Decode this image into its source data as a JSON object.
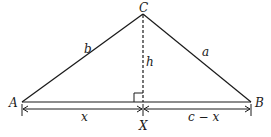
{
  "diagram": {
    "type": "triangle-altitude",
    "vertices": {
      "A": "A",
      "B": "B",
      "C": "C"
    },
    "foot": "X",
    "sides": {
      "b": "b",
      "a": "a",
      "h": "h"
    },
    "segments": {
      "left": "x",
      "right": "c − x"
    },
    "colors": {
      "stroke": "#1a1a1a",
      "background": "#ffffff"
    }
  }
}
